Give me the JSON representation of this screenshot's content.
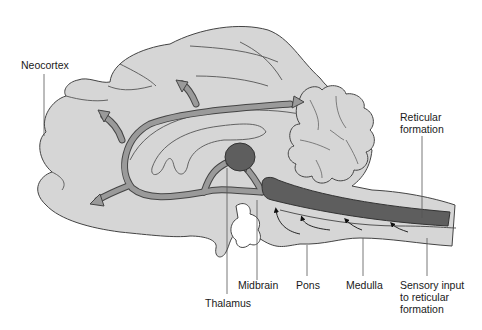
{
  "diagram": {
    "colors": {
      "brain_fill": "#d6d6d6",
      "outline": "#444444",
      "pathway_fill": "#9a9a9a",
      "reticular_fill": "#5e5e5e",
      "background": "#ffffff"
    },
    "labels": {
      "neocortex": "Neocortex",
      "reticular_formation_1": "Reticular",
      "reticular_formation_2": "formation",
      "thalamus": "Thalamus",
      "midbrain": "Midbrain",
      "pons": "Pons",
      "medulla": "Medulla",
      "sensory_input_1": "Sensory input",
      "sensory_input_2": "to reticular",
      "sensory_input_3": "formation"
    }
  }
}
